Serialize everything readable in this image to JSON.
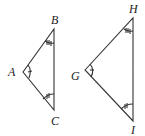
{
  "diagram": {
    "triangles": [
      {
        "name": "ABC",
        "vertices": {
          "A": "A",
          "B": "B",
          "C": "C"
        }
      },
      {
        "name": "GHI",
        "vertices": {
          "G": "G",
          "H": "H",
          "I": "I"
        }
      }
    ],
    "labels": {
      "A": "A",
      "B": "B",
      "C": "C",
      "G": "G",
      "H": "H",
      "I": "I"
    },
    "stroke_color": "#333333"
  }
}
